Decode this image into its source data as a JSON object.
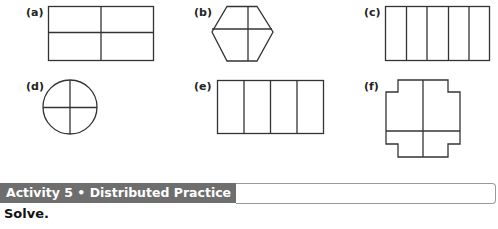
{
  "figures": [
    {
      "id": "a",
      "label": "(a)",
      "shape": "rectangle",
      "parts": 4,
      "division": "2x2 grid"
    },
    {
      "id": "b",
      "label": "(b)",
      "shape": "hexagon",
      "parts": 4,
      "division": "cross (off-center)"
    },
    {
      "id": "c",
      "label": "(c)",
      "shape": "rectangle",
      "parts": 5,
      "division": "5 vertical columns"
    },
    {
      "id": "d",
      "label": "(d)",
      "shape": "circle",
      "parts": 4,
      "division": "cross"
    },
    {
      "id": "e",
      "label": "(e)",
      "shape": "rectangle",
      "parts": 4,
      "division": "4 vertical columns"
    },
    {
      "id": "f",
      "label": "(f)",
      "shape": "stepped cross",
      "parts": 4,
      "division": "cross (off-center)"
    }
  ],
  "activity": {
    "title": "Activity 5 • Distributed Practice",
    "banner_color": "#6e6e6e"
  },
  "instruction": "Solve."
}
